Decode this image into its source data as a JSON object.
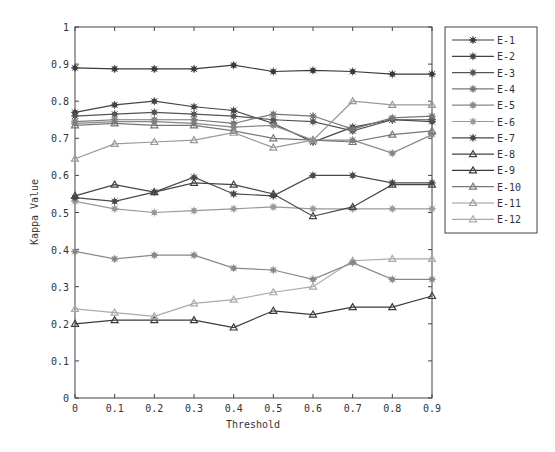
{
  "chart_data": {
    "type": "line",
    "title": "",
    "xlabel": "Threshold",
    "ylabel": "Kappa Value",
    "xlim": [
      0,
      0.9
    ],
    "ylim": [
      0,
      1
    ],
    "x": [
      0,
      0.1,
      0.2,
      0.3,
      0.4,
      0.5,
      0.6,
      0.7,
      0.8,
      0.9
    ],
    "x_tick_labels": [
      "0",
      "0.1",
      "0.2",
      "0.3",
      "0.4",
      "0.5",
      "0.6",
      "0.7",
      "0.8",
      "0.9"
    ],
    "y_ticks": [
      0,
      0.1,
      0.2,
      0.3,
      0.4,
      0.5,
      0.6,
      0.7,
      0.8,
      0.9,
      1
    ],
    "y_tick_labels": [
      "0",
      "0.1",
      "0.2",
      "0.3",
      "0.4",
      "0.5",
      "0.6",
      "0.7",
      "0.8",
      "0.9",
      "1"
    ],
    "grid": false,
    "legend_position": "outside-right-top",
    "series": [
      {
        "name": "E-1",
        "marker": "star",
        "color": "#3a3a3a",
        "values": [
          0.89,
          0.887,
          0.887,
          0.887,
          0.897,
          0.88,
          0.883,
          0.88,
          0.873,
          0.873
        ]
      },
      {
        "name": "E-2",
        "marker": "star",
        "color": "#444444",
        "values": [
          0.77,
          0.79,
          0.8,
          0.785,
          0.775,
          0.74,
          0.69,
          0.73,
          0.75,
          0.745
        ]
      },
      {
        "name": "E-3",
        "marker": "star",
        "color": "#555555",
        "values": [
          0.76,
          0.765,
          0.77,
          0.765,
          0.76,
          0.75,
          0.745,
          0.72,
          0.75,
          0.75
        ]
      },
      {
        "name": "E-4",
        "marker": "star",
        "color": "#777777",
        "values": [
          0.745,
          0.75,
          0.75,
          0.75,
          0.74,
          0.765,
          0.76,
          0.725,
          0.755,
          0.76
        ]
      },
      {
        "name": "E-5",
        "marker": "star",
        "color": "#888888",
        "values": [
          0.74,
          0.745,
          0.745,
          0.74,
          0.73,
          0.735,
          0.695,
          0.695,
          0.66,
          0.71
        ]
      },
      {
        "name": "E-6",
        "marker": "star",
        "color": "#999999",
        "values": [
          0.53,
          0.51,
          0.5,
          0.505,
          0.51,
          0.515,
          0.51,
          0.51,
          0.51,
          0.51
        ]
      },
      {
        "name": "E-7",
        "marker": "star",
        "color": "#4a4a4a",
        "values": [
          0.54,
          0.53,
          0.555,
          0.595,
          0.55,
          0.545,
          0.6,
          0.6,
          0.58,
          0.58
        ]
      },
      {
        "name": "E-8",
        "marker": "triangle",
        "color": "#444444",
        "values": [
          0.545,
          0.575,
          0.555,
          0.58,
          0.575,
          0.55,
          0.49,
          0.515,
          0.575,
          0.575
        ]
      },
      {
        "name": "E-9",
        "marker": "triangle",
        "color": "#3a3a3a",
        "values": [
          0.2,
          0.21,
          0.21,
          0.21,
          0.19,
          0.235,
          0.225,
          0.245,
          0.245,
          0.275
        ]
      },
      {
        "name": "E-10",
        "marker": "triangle",
        "color": "#777777",
        "values": [
          0.735,
          0.74,
          0.735,
          0.735,
          0.72,
          0.7,
          0.695,
          0.69,
          0.71,
          0.72
        ]
      },
      {
        "name": "E-11",
        "marker": "triangle",
        "color": "#999999",
        "values": [
          0.645,
          0.685,
          0.69,
          0.695,
          0.715,
          0.675,
          0.695,
          0.8,
          0.79,
          0.79
        ]
      },
      {
        "name": "E-12",
        "marker": "triangle",
        "color": "#aaaaaa",
        "values": [
          0.24,
          0.23,
          0.22,
          0.255,
          0.265,
          0.285,
          0.3,
          0.37,
          0.375,
          0.375
        ]
      }
    ],
    "extra_series_note": "A further star-marked line (~0.395 to 0.32) is visible in the plot",
    "extra_series": {
      "name": "E-?",
      "marker": "star",
      "color": "#888888",
      "values": [
        0.395,
        0.375,
        0.385,
        0.385,
        0.35,
        0.345,
        0.32,
        0.365,
        0.32,
        0.32
      ]
    }
  }
}
